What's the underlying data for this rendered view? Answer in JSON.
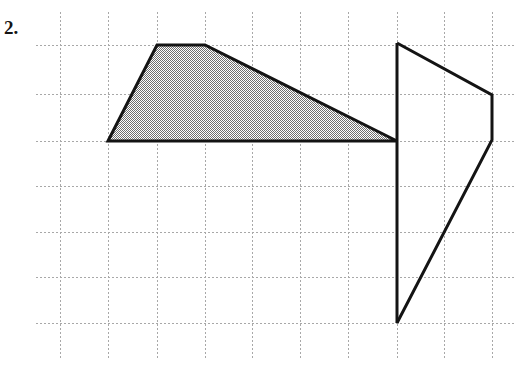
{
  "page": {
    "width": 524,
    "height": 370,
    "background_color": "#ffffff"
  },
  "problem": {
    "number_label": "2."
  },
  "grid": {
    "line_color": "#a8a8a8",
    "style": "dotted",
    "cell_width": 48,
    "cell_height": 46,
    "vertical_lines_x": [
      60,
      108,
      157,
      205,
      252,
      300,
      348,
      397,
      444,
      492
    ],
    "horizontal_lines_y": [
      45,
      94,
      141,
      186,
      232,
      277,
      323
    ],
    "vertical_span_y": [
      12,
      360
    ],
    "horizontal_span_x": [
      36,
      516
    ]
  },
  "figures": [
    {
      "name": "shaded-trapezoid",
      "filled": true,
      "fill_color": "#9a9a9a",
      "fill_pattern": "checkerboard-dither",
      "stroke_color": "#141414",
      "stroke_width": 3,
      "points": "108,141 157,45 205,45 397,141",
      "vertex_list": [
        [
          108,
          141
        ],
        [
          157,
          45
        ],
        [
          205,
          45
        ],
        [
          397,
          141
        ]
      ]
    },
    {
      "name": "open-quadrilateral",
      "filled": false,
      "fill_color": "none",
      "stroke_color": "#141414",
      "stroke_width": 3,
      "points": "397,43 492,95 492,140 397,323",
      "vertex_list": [
        [
          397,
          43
        ],
        [
          492,
          95
        ],
        [
          492,
          140
        ],
        [
          397,
          323
        ]
      ],
      "closing_edge": [
        [
          397,
          43
        ],
        [
          397,
          323
        ]
      ]
    }
  ]
}
